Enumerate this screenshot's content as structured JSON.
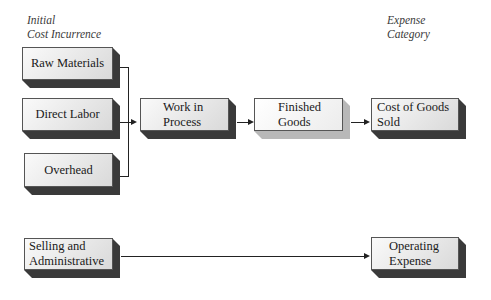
{
  "headers": {
    "left_line1": "Initial",
    "left_line2": "Cost Incurrence",
    "right_line1": "Expense",
    "right_line2": "Category"
  },
  "nodes": {
    "raw_materials": "Raw Materials",
    "direct_labor": "Direct Labor",
    "overhead": "Overhead",
    "work_in_process_l1": "Work in",
    "work_in_process_l2": "Process",
    "finished_goods_l1": "Finished",
    "finished_goods_l2": "Goods",
    "cogs_l1": "Cost of Goods",
    "cogs_l2": "Sold",
    "sga_l1": "Selling and",
    "sga_l2": "Administrative",
    "opex_l1": "Operating",
    "opex_l2": "Expense"
  },
  "edges": [
    {
      "from": "Raw Materials",
      "to": "Work in Process"
    },
    {
      "from": "Direct Labor",
      "to": "Work in Process"
    },
    {
      "from": "Overhead",
      "to": "Work in Process"
    },
    {
      "from": "Work in Process",
      "to": "Finished Goods"
    },
    {
      "from": "Finished Goods",
      "to": "Cost of Goods Sold"
    },
    {
      "from": "Selling and Administrative",
      "to": "Operating Expense"
    }
  ],
  "colors": {
    "dark_shadow": "#3a3a3a",
    "light_shadow": "#b8b8b8",
    "line": "#222222"
  }
}
